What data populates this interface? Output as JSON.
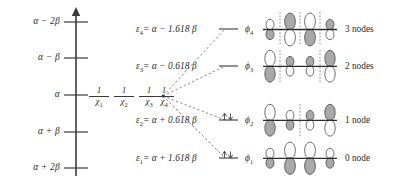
{
  "figure": {
    "type": "energy-level-diagram"
  },
  "axis": {
    "name": "energy-axis",
    "direction": "up",
    "ticks": [
      {
        "label": "α − 2β",
        "value": "alpha-2beta"
      },
      {
        "label": "α − β",
        "value": "alpha-1beta"
      },
      {
        "label": "α",
        "value": "alpha"
      },
      {
        "label": "α + β",
        "value": "alpha+1beta"
      },
      {
        "label": "α + 2β",
        "value": "alpha+2beta"
      }
    ]
  },
  "basis_orbitals": {
    "caption": "atomic p orbitals at energy alpha",
    "items": [
      {
        "num": "1",
        "den": "χ",
        "sub": "1",
        "full": "1/χ₁"
      },
      {
        "num": "1",
        "den": "χ",
        "sub": "2",
        "full": "1/χ₂"
      },
      {
        "num": "1",
        "den": "χ",
        "sub": "3",
        "full": "1/χ₃"
      },
      {
        "num": "1",
        "den": "χ",
        "sub": "4",
        "full": "1/χ₄"
      }
    ]
  },
  "levels": [
    {
      "id": "e4",
      "eps": "ε",
      "eps_sub": "4",
      "expr": "= α − 1.618 β",
      "coefficient": -1.618,
      "energy_text": "ε₄ = α − 1.618 β",
      "orbital": "ϕ",
      "orbital_sub": "4",
      "orbital_text": "ϕ₄",
      "nodes_text": "3 nodes",
      "nodes": 3,
      "electrons": 0,
      "electron_text": "",
      "phases": [
        "up",
        "down",
        "up",
        "down"
      ],
      "node_positions": [
        0.5,
        1.5,
        2.5
      ]
    },
    {
      "id": "e3",
      "eps": "ε",
      "eps_sub": "3",
      "expr": "= α − 0.618 β",
      "coefficient": -0.618,
      "energy_text": "ε₃ = α − 0.618 β",
      "orbital": "ϕ",
      "orbital_sub": "3",
      "orbital_text": "ϕ₃",
      "nodes_text": "2 nodes",
      "nodes": 2,
      "electrons": 0,
      "electron_text": "",
      "phases": [
        "down",
        "up",
        "down",
        "up"
      ],
      "node_positions": [
        0.5,
        2.5
      ]
    },
    {
      "id": "e2",
      "eps": "ε",
      "eps_sub": "2",
      "expr": "= α + 0.618 β",
      "coefficient": 0.618,
      "energy_text": "ε₂ = α + 0.618 β",
      "orbital": "ϕ",
      "orbital_sub": "2",
      "orbital_text": "ϕ₂",
      "nodes_text": "1 node",
      "nodes": 1,
      "electrons": 2,
      "electron_text": "↑↓",
      "phases": [
        "down",
        "down",
        "up",
        "up"
      ],
      "node_positions": [
        1.5
      ]
    },
    {
      "id": "e1",
      "eps": "ε",
      "eps_sub": "1",
      "expr": "= α + 1.618 β",
      "coefficient": 1.618,
      "energy_text": "ε₁ = α + 1.618 β",
      "orbital": "ϕ",
      "orbital_sub": "1",
      "orbital_text": "ϕ₁",
      "nodes_text": "0 node",
      "nodes": 0,
      "electrons": 2,
      "electron_text": "↑↓",
      "phases": [
        "down",
        "down",
        "down",
        "down"
      ],
      "node_positions": []
    }
  ],
  "colors": {
    "ink": "#2b2b2b",
    "line": "#3a3a3a",
    "lobe_fill_shaded": "#a9a9a9",
    "lobe_fill_open": "#ffffff",
    "lobe_stroke": "#4a4a4a",
    "node_dash": "#6e6e6e"
  }
}
